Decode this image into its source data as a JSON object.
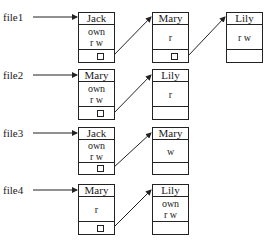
{
  "files": [
    {
      "label": "file1",
      "entries": [
        {
          "user": "Jack",
          "perms": [
            "own",
            "r w"
          ]
        },
        {
          "user": "Mary",
          "perms": [
            "r"
          ]
        },
        {
          "user": "Lily",
          "perms": [
            "r w"
          ]
        }
      ]
    },
    {
      "label": "file2",
      "entries": [
        {
          "user": "Mary",
          "perms": [
            "own",
            "r w"
          ]
        },
        {
          "user": "Lily",
          "perms": [
            "r"
          ]
        }
      ]
    },
    {
      "label": "file3",
      "entries": [
        {
          "user": "Jack",
          "perms": [
            "own",
            "r w"
          ]
        },
        {
          "user": "Mary",
          "perms": [
            "w"
          ]
        }
      ]
    },
    {
      "label": "file4",
      "entries": [
        {
          "user": "Mary",
          "perms": [
            "r"
          ]
        },
        {
          "user": "Lily",
          "perms": [
            "own",
            "r w"
          ]
        }
      ]
    }
  ]
}
